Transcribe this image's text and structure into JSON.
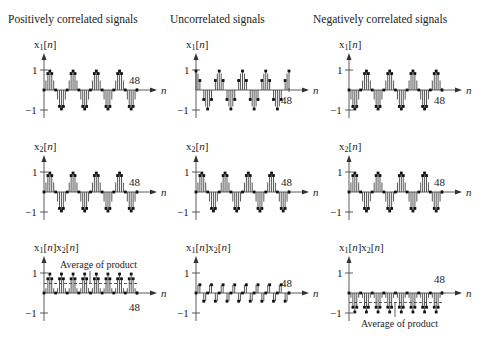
{
  "columns": [
    {
      "title": "Positively correlated signals",
      "axis_x": 44,
      "x1_fn": "sin",
      "x2_fn": "sin",
      "product_note": "Average of product",
      "note_pos": "above"
    },
    {
      "title": "Uncorrelated signals",
      "axis_x": 196,
      "x1_fn": "cos",
      "x2_fn": "sin",
      "product_note": "",
      "note_pos": ""
    },
    {
      "title": "Negatively correlated signals",
      "axis_x": 349,
      "x1_fn": "-sin",
      "x2_fn": "sin",
      "product_note": "Average of product",
      "note_pos": "below"
    }
  ],
  "rows": [
    {
      "ylabel": "x1[n]",
      "zero_y": 90,
      "unit": 20
    },
    {
      "ylabel": "x2[n]",
      "zero_y": 192,
      "unit": 20
    },
    {
      "ylabel": "x1[n]x2[n]",
      "zero_y": 293,
      "unit": 20
    }
  ],
  "axis": {
    "xlabel": "n",
    "ytick_pos": "1",
    "ytick_neg": "−1",
    "end_tick": "48"
  },
  "chart_data": {
    "type": "stem",
    "n_range": [
      0,
      48
    ],
    "period": 12,
    "panels": [
      {
        "col": "Positively correlated signals",
        "x1": "sin(2πn/12)",
        "x2": "sin(2πn/12)",
        "product_average": 0.5
      },
      {
        "col": "Uncorrelated signals",
        "x1": "cos(2πn/12)",
        "x2": "sin(2πn/12)",
        "product_average": 0
      },
      {
        "col": "Negatively correlated signals",
        "x1": "-sin(2πn/12)",
        "x2": "sin(2πn/12)",
        "product_average": -0.5
      }
    ],
    "ylim": [
      -1,
      1
    ],
    "annotations": [
      "Average of product",
      "48"
    ]
  }
}
